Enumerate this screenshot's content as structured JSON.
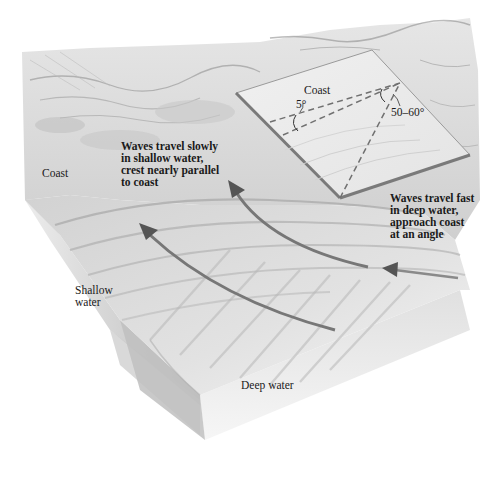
{
  "diagram": {
    "colors": {
      "background": "#ffffff",
      "terrain": "#d9d9d9",
      "terrain_dark": "#a8a8a8",
      "inset_fill": "#ececec",
      "inset_edge": "#7a7a7a",
      "arrow": "#6e6e6e",
      "text": "#1a1a1a"
    },
    "labels": {
      "coast_left": "Coast",
      "shallow_water": [
        "Shallow",
        "water"
      ],
      "deep_water": "Deep water",
      "slow_waves": [
        "Waves travel slowly",
        "in shallow water,",
        "crest nearly parallel",
        "to coast"
      ],
      "fast_waves": [
        "Waves travel fast",
        "in deep water,",
        "approach coast",
        "at an angle"
      ]
    },
    "inset": {
      "title": "Coast",
      "angle_shallow": "5°",
      "angle_deep": "50–60°"
    },
    "arrows": [
      {
        "name": "refraction-arrow-left",
        "description": "curved arrow from deep water bending toward shallow water (lower-left)"
      },
      {
        "name": "refraction-arrow-middle",
        "description": "curved arrow from deep water bending toward coast (center)"
      },
      {
        "name": "incoming-wave-arrow",
        "description": "short straight arrow in deep water pointing toward coast (right)"
      }
    ]
  }
}
